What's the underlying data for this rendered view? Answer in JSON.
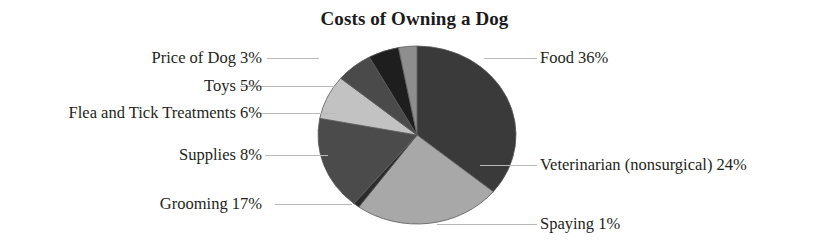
{
  "chart_data": {
    "type": "pie",
    "title": "Costs of Owning a Dog",
    "xlabel": "",
    "ylabel": "",
    "legend": "none",
    "grid": false,
    "value_unit": "percent",
    "total": 100,
    "start_angle_deg": 0,
    "direction": "clockwise",
    "categories": [
      "Food",
      "Veterinarian (nonsurgical)",
      "Spaying",
      "Grooming",
      "Supplies",
      "Flea and Tick Treatments",
      "Toys",
      "Price of Dog"
    ],
    "values": [
      36,
      24,
      1,
      17,
      8,
      6,
      5,
      3
    ],
    "slices": [
      {
        "name": "Food",
        "value": 36,
        "label": "Food 36%",
        "color": "#3a3a3a",
        "side": "right"
      },
      {
        "name": "Veterinarian (nonsurgical)",
        "value": 24,
        "label": "Veterinarian (nonsurgical) 24%",
        "color": "#a8a8a8",
        "side": "right"
      },
      {
        "name": "Spaying",
        "value": 1,
        "label": "Spaying 1%",
        "color": "#2b2b2b",
        "side": "right"
      },
      {
        "name": "Grooming",
        "value": 17,
        "label": "Grooming 17%",
        "color": "#4b4b4b",
        "side": "left"
      },
      {
        "name": "Supplies",
        "value": 8,
        "label": "Supplies 8%",
        "color": "#c2c2c2",
        "side": "left"
      },
      {
        "name": "Flea and Tick Treatments",
        "value": 6,
        "label": "Flea and Tick Treatments 6%",
        "color": "#4a4a4a",
        "side": "left"
      },
      {
        "name": "Toys",
        "value": 5,
        "label": "Toys 5%",
        "color": "#1e1e1e",
        "side": "left"
      },
      {
        "name": "Price of Dog",
        "value": 3,
        "label": "Price of Dog 3%",
        "color": "#8e8e8e",
        "side": "left"
      }
    ]
  },
  "labels": {
    "food": "Food 36%",
    "veterinarian": "Veterinarian (nonsurgical) 24%",
    "spaying": "Spaying 1%",
    "grooming": "Grooming 17%",
    "supplies": "Supplies 8%",
    "flea_tick": "Flea and Tick Treatments 6%",
    "toys": "Toys 5%",
    "price_of_dog": "Price of Dog 3%"
  },
  "colors": {
    "background": "#ffffff",
    "text": "#231f20",
    "leader_line": "#b9b9b9",
    "slice_outline": "#5a5a5a"
  }
}
